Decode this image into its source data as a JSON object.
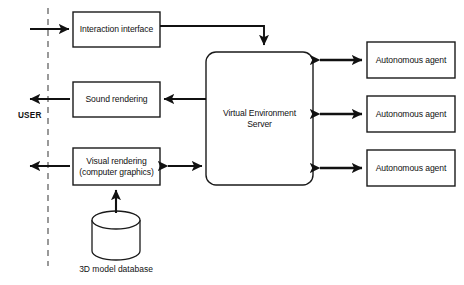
{
  "diagram": {
    "background_color": "#ffffff",
    "stroke_color": "#1a1a1a",
    "text_color": "#111111",
    "boundary": {
      "name": "user-boundary",
      "style": "dashed-vertical-line"
    },
    "actor": {
      "label": "USER"
    },
    "nodes": [
      {
        "id": "interaction",
        "label": "Interaction interface",
        "shape": "rect"
      },
      {
        "id": "sound",
        "label": "Sound rendering",
        "shape": "rect"
      },
      {
        "id": "visual",
        "label": "Visual rendering\n(computer graphics)",
        "shape": "rect"
      },
      {
        "id": "server",
        "label": "Virtual Environment\nServer",
        "shape": "rounded-rect"
      },
      {
        "id": "agent1",
        "label": "Autonomous agent",
        "shape": "rect"
      },
      {
        "id": "agent2",
        "label": "Autonomous agent",
        "shape": "rect"
      },
      {
        "id": "agent3",
        "label": "Autonomous agent",
        "shape": "rect"
      },
      {
        "id": "database",
        "label": "3D model database",
        "shape": "cylinder"
      }
    ],
    "edges": [
      {
        "from": "user",
        "to": "interaction",
        "direction": "forward"
      },
      {
        "from": "interaction",
        "to": "server",
        "direction": "forward"
      },
      {
        "from": "server",
        "to": "sound",
        "direction": "forward"
      },
      {
        "from": "sound",
        "to": "user",
        "direction": "forward"
      },
      {
        "from": "server",
        "to": "visual",
        "direction": "bidirectional"
      },
      {
        "from": "visual",
        "to": "user",
        "direction": "forward"
      },
      {
        "from": "database",
        "to": "visual",
        "direction": "forward"
      },
      {
        "from": "server",
        "to": "agent1",
        "direction": "bidirectional"
      },
      {
        "from": "server",
        "to": "agent2",
        "direction": "bidirectional"
      },
      {
        "from": "server",
        "to": "agent3",
        "direction": "bidirectional"
      }
    ]
  }
}
